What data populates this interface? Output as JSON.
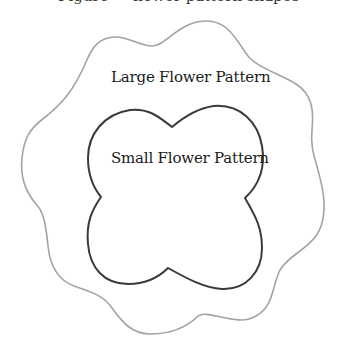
{
  "diagram": {
    "top_caption_clipped": "Figure — flower pattern shapes",
    "shapes": [
      {
        "id": "large",
        "label": "Large Flower Pattern",
        "stroke": "#a3a3a3",
        "stroke_width": 1.6
      },
      {
        "id": "small",
        "label": "Small Flower Pattern",
        "stroke": "#3a3a3a",
        "stroke_width": 2
      }
    ],
    "background": "#ffffff"
  }
}
